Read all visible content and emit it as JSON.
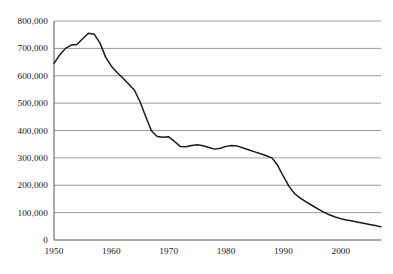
{
  "chart_data": {
    "type": "line",
    "title": "",
    "subtitle": "",
    "xlabel": "",
    "ylabel": "",
    "xlim": [
      1950,
      2007
    ],
    "ylim": [
      0,
      800000
    ],
    "grid": "horizontal",
    "legend": "none",
    "x_ticks": [
      "1950",
      "1960",
      "1970",
      "1980",
      "1990",
      "2000"
    ],
    "x_tick_values": [
      1950,
      1960,
      1970,
      1980,
      1990,
      2000
    ],
    "y_ticks": [
      "0",
      "100,000",
      "200,000",
      "300,000",
      "400,000",
      "500,000",
      "600,000",
      "700,000",
      "800,000"
    ],
    "y_tick_values": [
      0,
      100000,
      200000,
      300000,
      400000,
      500000,
      600000,
      700000,
      800000
    ],
    "series": [
      {
        "name": "series-1",
        "color": "#1a1a1a",
        "x": [
          1950,
          1951,
          1952,
          1953,
          1954,
          1955,
          1956,
          1957,
          1958,
          1959,
          1960,
          1961,
          1962,
          1963,
          1964,
          1965,
          1966,
          1967,
          1968,
          1969,
          1970,
          1971,
          1972,
          1973,
          1974,
          1975,
          1976,
          1977,
          1978,
          1979,
          1980,
          1981,
          1982,
          1983,
          1984,
          1985,
          1986,
          1987,
          1988,
          1989,
          1990,
          1991,
          1992,
          1993,
          1994,
          1995,
          1996,
          1997,
          1998,
          1999,
          2000,
          2001,
          2002,
          2003,
          2004,
          2005,
          2006,
          2007
        ],
        "values": [
          645000,
          676000,
          700000,
          712000,
          714000,
          735000,
          755000,
          752000,
          720000,
          668000,
          635000,
          612000,
          592000,
          570000,
          548000,
          505000,
          450000,
          398000,
          378000,
          375000,
          377000,
          360000,
          342000,
          341000,
          345000,
          348000,
          344000,
          338000,
          332000,
          335000,
          342000,
          345000,
          343000,
          336000,
          329000,
          322000,
          315000,
          308000,
          300000,
          272000,
          232000,
          195000,
          168000,
          152000,
          138000,
          126000,
          114000,
          102000,
          92000,
          84000,
          78000,
          73000,
          69000,
          65000,
          61000,
          57000,
          53000,
          48000
        ]
      }
    ],
    "annotations": []
  },
  "axes": {
    "y_axis_name": "value-axis",
    "x_axis_name": "year-axis"
  }
}
